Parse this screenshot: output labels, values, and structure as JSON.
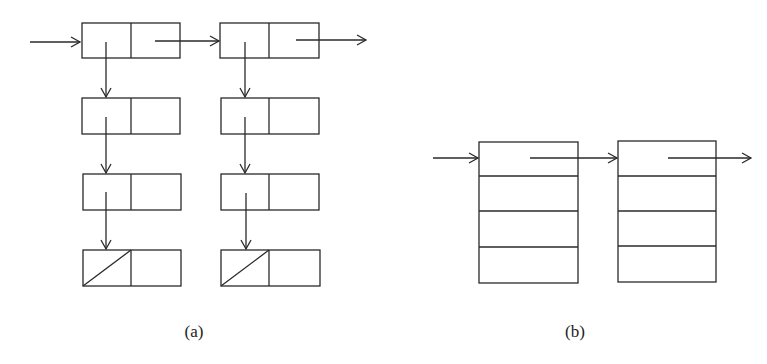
{
  "figure": {
    "stroke_color": "#2a2a2a",
    "background": "#ffffff",
    "labels": {
      "a": "(a)",
      "b": "(b)"
    }
  },
  "part_a": {
    "description": "Two header nodes linked horizontally, each with a vertical chain of two-field nodes; last node's first field null (diagonal)",
    "columns": [
      {
        "x": 82,
        "rows_y": [
          23,
          98,
          174,
          250
        ],
        "null_terminated": true
      },
      {
        "x": 221,
        "rows_y": [
          23,
          98,
          174,
          250
        ],
        "null_terminated": true
      }
    ],
    "node_width": 98,
    "node_height": 35
  },
  "part_b": {
    "description": "Two blocks of four stacked cells linked horizontally",
    "blocks": [
      {
        "x": 479,
        "y": 142,
        "cells": 4
      },
      {
        "x": 618,
        "y": 141,
        "cells": 4
      }
    ],
    "block_width": 98,
    "block_height": 141
  }
}
